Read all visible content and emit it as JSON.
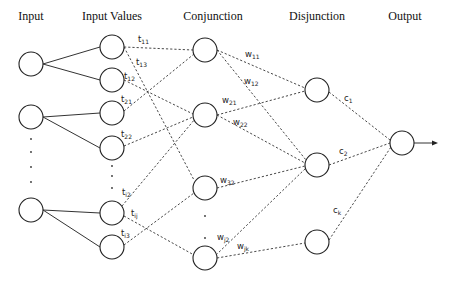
{
  "diagram": {
    "headers": [
      {
        "id": "input",
        "label": "Input",
        "x": 31
      },
      {
        "id": "input-values",
        "label": "Input Values",
        "x": 112
      },
      {
        "id": "conjunction",
        "label": "Conjunction",
        "x": 205
      },
      {
        "id": "disjunction",
        "label": "Disjunction",
        "x": 317
      },
      {
        "id": "output",
        "label": "Output",
        "x": 402
      }
    ],
    "nodes": {
      "input": [
        {
          "id": "in1",
          "x": 31,
          "y": 64
        },
        {
          "id": "in2",
          "x": 31,
          "y": 117
        },
        {
          "id": "in3",
          "x": 31,
          "y": 210
        }
      ],
      "input_values": [
        {
          "id": "iv1",
          "x": 112,
          "y": 47
        },
        {
          "id": "iv2",
          "x": 112,
          "y": 80
        },
        {
          "id": "iv3",
          "x": 112,
          "y": 113
        },
        {
          "id": "iv4",
          "x": 112,
          "y": 148
        },
        {
          "id": "iv5",
          "x": 112,
          "y": 213
        },
        {
          "id": "iv6",
          "x": 112,
          "y": 247
        }
      ],
      "conjunction": [
        {
          "id": "c1n",
          "x": 205,
          "y": 50
        },
        {
          "id": "c2n",
          "x": 205,
          "y": 115
        },
        {
          "id": "c3n",
          "x": 205,
          "y": 188
        },
        {
          "id": "c4n",
          "x": 205,
          "y": 258
        }
      ],
      "disjunction": [
        {
          "id": "d1",
          "x": 317,
          "y": 90
        },
        {
          "id": "d2",
          "x": 317,
          "y": 165
        },
        {
          "id": "d3",
          "x": 317,
          "y": 242
        }
      ],
      "output": [
        {
          "id": "out",
          "x": 402,
          "y": 143
        }
      ]
    },
    "edges_solid": [
      {
        "from": "in1",
        "to": "iv1"
      },
      {
        "from": "in1",
        "to": "iv2"
      },
      {
        "from": "in2",
        "to": "iv3"
      },
      {
        "from": "in2",
        "to": "iv4"
      },
      {
        "from": "in3",
        "to": "iv5"
      },
      {
        "from": "in3",
        "to": "iv6"
      }
    ],
    "edge_labels": {
      "t11": {
        "base": "t",
        "sub": "11"
      },
      "t13": {
        "base": "t",
        "sub": "13"
      },
      "t12": {
        "base": "t",
        "sub": "12"
      },
      "t21": {
        "base": "t",
        "sub": "21"
      },
      "t22": {
        "base": "t",
        "sub": "22"
      },
      "ti2": {
        "base": "t",
        "sub": "i2"
      },
      "tij": {
        "base": "t",
        "sub": "ij"
      },
      "ti3": {
        "base": "t",
        "sub": "i3"
      },
      "w11": {
        "base": "w",
        "sub": "11"
      },
      "w12": {
        "base": "w",
        "sub": "12"
      },
      "w21": {
        "base": "w",
        "sub": "21"
      },
      "w22": {
        "base": "w",
        "sub": "22"
      },
      "w32": {
        "base": "w",
        "sub": "32"
      },
      "wj2": {
        "base": "w",
        "sub": "j2"
      },
      "wjk": {
        "base": "w",
        "sub": "jk"
      },
      "c1": {
        "base": "c",
        "sub": "1"
      },
      "c2": {
        "base": "c",
        "sub": "2"
      },
      "ck": {
        "base": "c",
        "sub": "k"
      }
    },
    "edges_dashed": [
      {
        "from": "iv1",
        "to": "c1n",
        "label": "t11"
      },
      {
        "from": "iv1",
        "to": "c3n",
        "label": "t13"
      },
      {
        "from": "iv2",
        "to": "c2n",
        "label": "t12"
      },
      {
        "from": "iv3",
        "to": "c1n",
        "label": "t21"
      },
      {
        "from": "iv4",
        "to": "c2n",
        "label": "t22"
      },
      {
        "from": "iv5",
        "to": "c2n",
        "label": "ti2"
      },
      {
        "from": "iv5",
        "to": "c4n",
        "label": "tij"
      },
      {
        "from": "iv6",
        "to": "c3n",
        "label": "ti3"
      },
      {
        "from": "c1n",
        "to": "d1",
        "label": "w11"
      },
      {
        "from": "c1n",
        "to": "d2",
        "label": "w12"
      },
      {
        "from": "c2n",
        "to": "d1",
        "label": "w21"
      },
      {
        "from": "c2n",
        "to": "d2",
        "label": "w22"
      },
      {
        "from": "c3n",
        "to": "d2",
        "label": "w32"
      },
      {
        "from": "c4n",
        "to": "d2",
        "label": "wj2"
      },
      {
        "from": "c4n",
        "to": "d3",
        "label": "wjk"
      },
      {
        "from": "d1",
        "to": "out",
        "label": "c1"
      },
      {
        "from": "d2",
        "to": "out",
        "label": "c2"
      },
      {
        "from": "d3",
        "to": "out",
        "label": "ck"
      }
    ],
    "output_arrow": {
      "from_x": 414,
      "to_x": 438,
      "y": 143
    },
    "ellipsis_dots": [
      {
        "x": 31,
        "y": 152
      },
      {
        "x": 31,
        "y": 167
      },
      {
        "x": 31,
        "y": 182
      },
      {
        "x": 112,
        "y": 169
      },
      {
        "x": 112,
        "y": 181
      },
      {
        "x": 112,
        "y": 193
      },
      {
        "x": 205,
        "y": 215
      },
      {
        "x": 205,
        "y": 238
      }
    ]
  }
}
